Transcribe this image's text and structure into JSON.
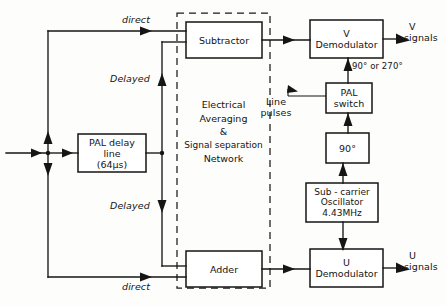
{
  "diagram": {
    "boxes": [
      {
        "id": "subtractor",
        "label_lines": [
          "Subtractor"
        ]
      },
      {
        "id": "adder",
        "label_lines": [
          "Adder"
        ]
      },
      {
        "id": "pal-delay-line",
        "label_lines": [
          "PAL delay",
          "line",
          "(64μs)"
        ]
      },
      {
        "id": "v-demodulator",
        "label_lines": [
          "V",
          "Demodulator"
        ]
      },
      {
        "id": "u-demodulator",
        "label_lines": [
          "U",
          "Demodulator"
        ]
      },
      {
        "id": "pal-switch",
        "label_lines": [
          "PAL",
          "switch"
        ]
      },
      {
        "id": "phase-shifter-90",
        "label_lines": [
          "90°"
        ]
      },
      {
        "id": "sub-carrier-oscillator",
        "label_lines": [
          "Sub - carrier",
          "Oscillator",
          "4.43MHz"
        ]
      }
    ],
    "dashed_region": {
      "label_lines": [
        "Electrical",
        "Averaging",
        "&",
        "Signal separation",
        "Network"
      ]
    },
    "wire_labels": {
      "direct_top": "direct",
      "direct_bottom": "direct",
      "delayed_top": "Delayed",
      "delayed_bottom": "Delayed",
      "phase_select": "90° or 270°",
      "line_pulses": [
        "Line",
        "pulses"
      ],
      "v_signals": [
        "V",
        "signals"
      ],
      "u_signals": [
        "U",
        "signals"
      ]
    },
    "colors": {
      "ink": "#151515",
      "paper": "#fdfdfb"
    }
  }
}
